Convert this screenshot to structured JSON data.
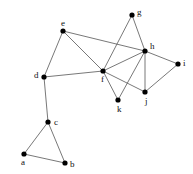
{
  "figure": {
    "type": "node-link-graph",
    "width": 193,
    "height": 174,
    "background_color": "#ffffff",
    "node_color": "#000000",
    "edge_color": "#555555",
    "label_color": "#111111"
  },
  "graph_data": {
    "type": "graph",
    "directed": false,
    "node_count": 11,
    "edge_count": 17,
    "nodes": [
      {
        "id": "a",
        "label": "a",
        "x": 24,
        "y": 154,
        "label_dx": -3,
        "label_dy": 11,
        "r": 2.6
      },
      {
        "id": "b",
        "label": "b",
        "x": 65,
        "y": 163,
        "label_dx": 5,
        "label_dy": 4,
        "r": 2.6
      },
      {
        "id": "c",
        "label": "c",
        "x": 48,
        "y": 122,
        "label_dx": 6,
        "label_dy": 3,
        "r": 2.6
      },
      {
        "id": "d",
        "label": "d",
        "x": 44,
        "y": 77,
        "label_dx": -10,
        "label_dy": 1,
        "r": 2.6
      },
      {
        "id": "e",
        "label": "e",
        "x": 63,
        "y": 31,
        "label_dx": -2,
        "label_dy": -5,
        "r": 2.6
      },
      {
        "id": "f",
        "label": "f",
        "x": 103,
        "y": 71,
        "label_dx": -2,
        "label_dy": 11,
        "r": 2.6
      },
      {
        "id": "g",
        "label": "g",
        "x": 132,
        "y": 15,
        "label_dx": 5,
        "label_dy": 0,
        "r": 2.6
      },
      {
        "id": "h",
        "label": "h",
        "x": 145,
        "y": 51,
        "label_dx": 5,
        "label_dy": -2,
        "r": 2.6
      },
      {
        "id": "i",
        "label": "i",
        "x": 178,
        "y": 64,
        "label_dx": 5,
        "label_dy": 2,
        "r": 2.6
      },
      {
        "id": "j",
        "label": "j",
        "x": 145,
        "y": 92,
        "label_dx": 0,
        "label_dy": 12,
        "r": 2.6
      },
      {
        "id": "k",
        "label": "k",
        "x": 118,
        "y": 100,
        "label_dx": -1,
        "label_dy": 12,
        "r": 2.6
      }
    ],
    "edges": [
      {
        "source": "a",
        "target": "b"
      },
      {
        "source": "a",
        "target": "c"
      },
      {
        "source": "b",
        "target": "c"
      },
      {
        "source": "c",
        "target": "d"
      },
      {
        "source": "d",
        "target": "e"
      },
      {
        "source": "d",
        "target": "f"
      },
      {
        "source": "e",
        "target": "f"
      },
      {
        "source": "e",
        "target": "h"
      },
      {
        "source": "f",
        "target": "g"
      },
      {
        "source": "f",
        "target": "h"
      },
      {
        "source": "f",
        "target": "j"
      },
      {
        "source": "f",
        "target": "k"
      },
      {
        "source": "g",
        "target": "h"
      },
      {
        "source": "h",
        "target": "i"
      },
      {
        "source": "h",
        "target": "j"
      },
      {
        "source": "h",
        "target": "k"
      },
      {
        "source": "i",
        "target": "j"
      }
    ]
  }
}
